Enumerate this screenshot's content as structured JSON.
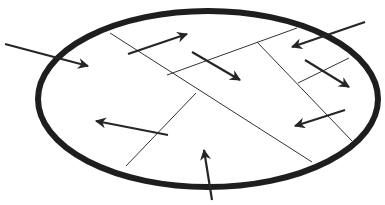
{
  "diagram": {
    "colors": {
      "outline": "#1e1e1e",
      "boundary": "#333333",
      "arrow": "#262626",
      "background": "#ffffff"
    },
    "ellipse": {
      "cx": 208,
      "cy": 99,
      "rx": 170,
      "ry": 88,
      "stroke_width": 6
    },
    "boundaries": [
      {
        "x1": 110,
        "y1": 33,
        "x2": 312,
        "y2": 162
      },
      {
        "x1": 167,
        "y1": 75,
        "x2": 297,
        "y2": 28
      },
      {
        "x1": 257,
        "y1": 42,
        "x2": 352,
        "y2": 141
      },
      {
        "x1": 298,
        "y1": 83,
        "x2": 349,
        "y2": 58
      },
      {
        "x1": 126,
        "y1": 166,
        "x2": 196,
        "y2": 93
      }
    ],
    "arrows": [
      {
        "x1": 5,
        "y1": 44,
        "x2": 88,
        "y2": 66
      },
      {
        "x1": 128,
        "y1": 54,
        "x2": 187,
        "y2": 34
      },
      {
        "x1": 192,
        "y1": 52,
        "x2": 240,
        "y2": 80
      },
      {
        "x1": 365,
        "y1": 22,
        "x2": 292,
        "y2": 47
      },
      {
        "x1": 305,
        "y1": 60,
        "x2": 349,
        "y2": 87
      },
      {
        "x1": 345,
        "y1": 110,
        "x2": 295,
        "y2": 126
      },
      {
        "x1": 168,
        "y1": 135,
        "x2": 96,
        "y2": 121
      },
      {
        "x1": 212,
        "y1": 200,
        "x2": 204,
        "y2": 150
      }
    ]
  }
}
